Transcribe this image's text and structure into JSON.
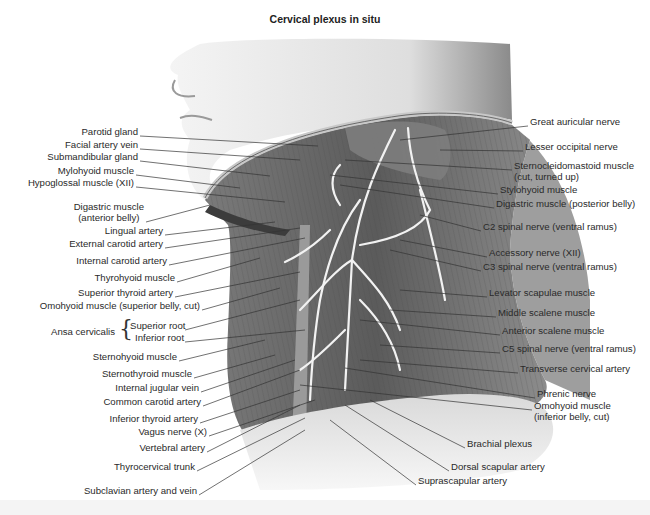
{
  "title": "Cervical plexus in situ",
  "left_labels": [
    {
      "id": "parotid-gland",
      "text": "Parotid gland",
      "x": 138,
      "y": 131
    },
    {
      "id": "facial-artery-vein",
      "text": "Facial artery vein",
      "x": 138,
      "y": 144
    },
    {
      "id": "submandibular-gland",
      "text": "Submandibular gland",
      "x": 138,
      "y": 156
    },
    {
      "id": "mylohyoid-muscle",
      "text": "Mylohyoid muscle",
      "x": 134,
      "y": 170
    },
    {
      "id": "hypoglossal-muscle",
      "text": "Hypoglossal muscle (XII)",
      "x": 134,
      "y": 182
    },
    {
      "id": "digastric-anterior-1",
      "text": "Digastric muscle",
      "x": 144,
      "y": 206
    },
    {
      "id": "digastric-anterior-2",
      "text": "(anterior belly)",
      "x": 144,
      "y": 217
    },
    {
      "id": "lingual-artery",
      "text": "Lingual artery",
      "x": 163,
      "y": 230
    },
    {
      "id": "external-carotid-artery",
      "text": "External carotid artery",
      "x": 163,
      "y": 243
    },
    {
      "id": "internal-carotid-artery",
      "text": "Internal carotid artery",
      "x": 167,
      "y": 260
    },
    {
      "id": "thyrohyoid-muscle",
      "text": "Thyrohyoid muscle",
      "x": 175,
      "y": 277
    },
    {
      "id": "superior-thyroid-artery",
      "text": "Superior thyroid artery",
      "x": 173,
      "y": 292
    },
    {
      "id": "omohyoid-superior",
      "text": "Omohyoid muscle (superior belly, cut)",
      "x": 200,
      "y": 305
    },
    {
      "id": "ansa-superior-root",
      "text": "Superior root",
      "x": 183,
      "y": 325
    },
    {
      "id": "ansa-inferior-root",
      "text": "Inferior root",
      "x": 183,
      "y": 337
    },
    {
      "id": "sternohyoid-muscle",
      "text": "Sternohyoid muscle",
      "x": 177,
      "y": 356
    },
    {
      "id": "sternothyroid-muscle",
      "text": "Sternothyroid muscle",
      "x": 192,
      "y": 373
    },
    {
      "id": "internal-jugular-vein",
      "text": "Internal jugular vein",
      "x": 199,
      "y": 387
    },
    {
      "id": "common-carotid-artery",
      "text": "Common carotid artery",
      "x": 201,
      "y": 401
    },
    {
      "id": "inferior-thyroid-artery",
      "text": "Inferior thyroid artery",
      "x": 198,
      "y": 418
    },
    {
      "id": "vagus-nerve",
      "text": "Vagus nerve (X)",
      "x": 207,
      "y": 431
    },
    {
      "id": "vertebral-artery",
      "text": "Vertebral artery",
      "x": 205,
      "y": 447
    },
    {
      "id": "thyrocervical-trunk",
      "text": "Thyrocervical trunk",
      "x": 195,
      "y": 466
    },
    {
      "id": "subclavian-artery-vein",
      "text": "Subclavian artery and vein",
      "x": 197,
      "y": 490
    }
  ],
  "ansa_cervicalis": {
    "text": "Ansa cervicalis",
    "x": 115,
    "y": 331
  },
  "right_labels": [
    {
      "id": "great-auricular-nerve",
      "text": "Great auricular nerve",
      "x": 530,
      "y": 121
    },
    {
      "id": "lesser-occipital-nerve",
      "text": "Lesser occipital nerve",
      "x": 525,
      "y": 146
    },
    {
      "id": "scm-1",
      "text": "Sternocleidomastoid muscle",
      "x": 514,
      "y": 165
    },
    {
      "id": "scm-2",
      "text": "(cut, turned up)",
      "x": 514,
      "y": 176
    },
    {
      "id": "stylohyoid-muscle",
      "text": "Stylohyoid muscle",
      "x": 500,
      "y": 189
    },
    {
      "id": "digastric-posterior",
      "text": "Digastric muscle (posterior belly)",
      "x": 496,
      "y": 203
    },
    {
      "id": "c2-spinal-nerve",
      "text": "C2 spinal nerve (ventral ramus)",
      "x": 483,
      "y": 226
    },
    {
      "id": "accessory-nerve",
      "text": "Accessory nerve (XII)",
      "x": 489,
      "y": 252
    },
    {
      "id": "c3-spinal-nerve",
      "text": "C3 spinal nerve (ventral ramus)",
      "x": 483,
      "y": 266
    },
    {
      "id": "levator-scapulae",
      "text": "Levator scapulae muscle",
      "x": 489,
      "y": 292
    },
    {
      "id": "middle-scalene",
      "text": "Middle scalene muscle",
      "x": 498,
      "y": 312
    },
    {
      "id": "anterior-scalene",
      "text": "Anterior scalene muscle",
      "x": 502,
      "y": 330
    },
    {
      "id": "c5-spinal-nerve",
      "text": "C5 spinal nerve (ventral ramus)",
      "x": 502,
      "y": 348
    },
    {
      "id": "transverse-cervical-artery",
      "text": "Transverse cervical artery",
      "x": 520,
      "y": 368
    },
    {
      "id": "phrenic-nerve",
      "text": "Phrenic nerve",
      "x": 537,
      "y": 393
    },
    {
      "id": "omohyoid-inferior-1",
      "text": "Omohyoid muscle",
      "x": 534,
      "y": 405
    },
    {
      "id": "omohyoid-inferior-2",
      "text": "(inferior belly, cut)",
      "x": 534,
      "y": 416
    },
    {
      "id": "brachial-plexus",
      "text": "Brachial plexus",
      "x": 467,
      "y": 443
    },
    {
      "id": "dorsal-scapular-artery",
      "text": "Dorsal scapular artery",
      "x": 451,
      "y": 466
    },
    {
      "id": "suprascapular-artery",
      "text": "Suprascapular artery",
      "x": 418,
      "y": 480
    }
  ],
  "colors": {
    "background": "#ffffff",
    "skin": "#e6e6e6",
    "muscle_dark": "#5a5a5a",
    "muscle_mid": "#8a8a8a",
    "nerve": "#f2f2f2",
    "leader_line": "#333333"
  }
}
